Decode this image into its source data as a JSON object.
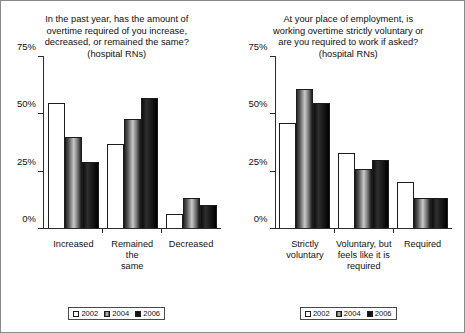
{
  "figure": {
    "series_names": [
      "2002",
      "2004",
      "2006"
    ],
    "axis": {
      "yticks": [
        "0%",
        "25%",
        "50%",
        "75%"
      ],
      "ymin": 0,
      "ymax": 75
    },
    "colors": {
      "series_2002": "#ffffff",
      "series_2004": "#8c8c8c",
      "series_2006": "#121212",
      "axis": "#2b2b2b",
      "border": "#8a8a8a",
      "text": "#111111"
    }
  },
  "chart_data": [
    {
      "type": "bar",
      "title": "In the past year, has the amount of overtime required of you increase, decreased, or remained the same? (hospital RNs)",
      "title_lines": [
        "In the past year, has the amount of",
        "overtime required of you increase,",
        "decreased, or remained the same?",
        "(hospital RNs)"
      ],
      "categories": [
        "Increased",
        "Remained the same",
        "Decreased"
      ],
      "category_lines": [
        [
          "Increased"
        ],
        [
          "Remained the",
          "same"
        ],
        [
          "Decreased"
        ]
      ],
      "series": [
        {
          "name": "2002",
          "values": [
            55,
            37,
            6
          ]
        },
        {
          "name": "2004",
          "values": [
            40,
            48,
            13
          ]
        },
        {
          "name": "2006",
          "values": [
            29,
            57,
            10
          ]
        }
      ],
      "xlabel": "",
      "ylabel": "",
      "ylim": [
        0,
        75
      ],
      "yticks": [
        0,
        25,
        50,
        75
      ],
      "ytick_labels": [
        "0%",
        "25%",
        "50%",
        "75%"
      ],
      "grid": false,
      "legend": [
        "2002",
        "2004",
        "2006"
      ],
      "legend_position": "bottom-center"
    },
    {
      "type": "bar",
      "title": "At your place of employment, is working overtime strictly voluntary or are you required to work if asked? (hospital RNs)",
      "title_lines": [
        "At your place of employment, is",
        "working overtime strictly voluntary or",
        "are you required to work if asked?",
        "(hospital RNs)"
      ],
      "categories": [
        "Strictly voluntary",
        "Voluntary, but feels like it is required",
        "Required"
      ],
      "category_lines": [
        [
          "Strictly",
          "voluntary"
        ],
        [
          "Voluntary, but",
          "feels like it is",
          "required"
        ],
        [
          "Required"
        ]
      ],
      "series": [
        {
          "name": "2002",
          "values": [
            46,
            33,
            20
          ]
        },
        {
          "name": "2004",
          "values": [
            61,
            26,
            13
          ]
        },
        {
          "name": "2006",
          "values": [
            55,
            30,
            13
          ]
        }
      ],
      "xlabel": "",
      "ylabel": "",
      "ylim": [
        0,
        75
      ],
      "yticks": [
        0,
        25,
        50,
        75
      ],
      "ytick_labels": [
        "0%",
        "25%",
        "50%",
        "75%"
      ],
      "grid": false,
      "legend": [
        "2002",
        "2004",
        "2006"
      ],
      "legend_position": "bottom-center"
    }
  ]
}
